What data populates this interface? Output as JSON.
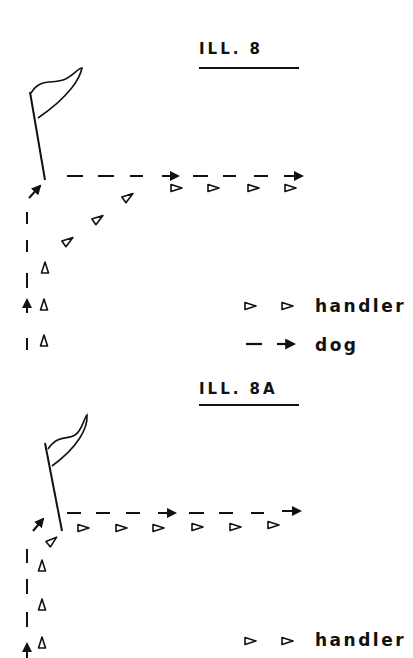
{
  "figures": [
    {
      "id": "ill8",
      "title": "ILL. 8",
      "description": "Dog runs along the handler's side, passes the flag, then the handler turns diagonally and the dog continues straight along the top line",
      "legend": [
        {
          "symbol": "handler-triangles",
          "label": "handler"
        },
        {
          "symbol": "dog-dashed-arrow",
          "label": "dog"
        }
      ]
    },
    {
      "id": "ill8a",
      "title": "ILL. 8A",
      "description": "Dog runs up the side, turns sharply at the flag and continues right; handler turns at the flag and walks along the top line",
      "legend": [
        {
          "symbol": "handler-triangles",
          "label": "handler"
        }
      ]
    }
  ],
  "colors": {
    "ink": "#111111",
    "background": "#ffffff"
  }
}
